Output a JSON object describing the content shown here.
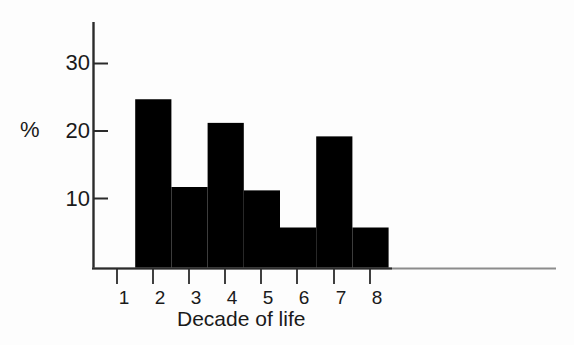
{
  "chart_data": {
    "type": "bar",
    "title": "",
    "subtitle": "",
    "xlabel": "Decade of life",
    "ylabel": "%",
    "categories": [
      "1",
      "2",
      "3",
      "4",
      "5",
      "6",
      "7",
      "8"
    ],
    "values": [
      0,
      25,
      12,
      21.5,
      11.5,
      6,
      19.5,
      6
    ],
    "xlim": [
      0.5,
      8.5
    ],
    "ylim": [
      0,
      33
    ],
    "ytick_values": [
      10,
      20,
      30
    ],
    "ytick_labels": [
      "10",
      "20",
      "30"
    ],
    "xtick_labels": [
      "1",
      "2",
      "3",
      "4",
      "5",
      "6",
      "7",
      "8"
    ],
    "grid": false,
    "legend": null,
    "bar_color": "#000000",
    "axis_color": "#1a1a1a",
    "background_color": "#fdfdfd",
    "style": "histogram, contiguous bars, no gaps, first decade empty",
    "annotations": []
  },
  "axes": {
    "y_axis_name": "percent-axis",
    "x_axis_name": "decade-axis",
    "y_label_text": "%",
    "x_label_text": "Decade of life"
  }
}
